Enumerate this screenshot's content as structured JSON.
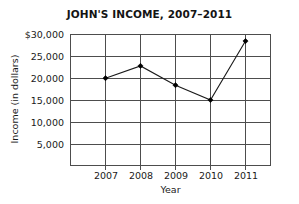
{
  "chart_data": {
    "type": "line",
    "title": "JOHN'S INCOME, 2007–2011",
    "xlabel": "Year",
    "ylabel": "Income (in dollars)",
    "categories": [
      "2007",
      "2008",
      "2009",
      "2010",
      "2011"
    ],
    "values": [
      20000,
      22800,
      18400,
      15000,
      28500
    ],
    "series": [
      {
        "name": "Income",
        "values": [
          20000,
          22800,
          18400,
          15000,
          28500
        ]
      }
    ],
    "ylim": [
      0,
      30000
    ],
    "ytick_values": [
      5000,
      10000,
      15000,
      20000,
      25000,
      30000
    ],
    "ytick_labels": [
      "5,000",
      "10,000",
      "15,000",
      "20,000",
      "25,000",
      "$30,000"
    ],
    "xtick_labels": [
      "2007",
      "2008",
      "2009",
      "2010",
      "2011"
    ],
    "grid": true,
    "legend": "none",
    "line_color": "#1a1a1a",
    "marker": "diamond",
    "marker_color": "#000000",
    "grid_color": "#4d4d4d",
    "background_color": "#ffffff"
  }
}
